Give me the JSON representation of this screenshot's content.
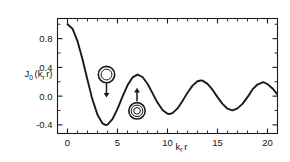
{
  "figure": {
    "background_color": "#ffffff",
    "line_color": "#1a1a1a",
    "axis_color": "#1a1a1a"
  },
  "axes": {
    "x_title_main": "k",
    "x_title_sub": "r",
    "x_title_tail": "r",
    "y_title_main": "J",
    "y_title_sub": "0",
    "y_title_open": "(k",
    "y_title_sub2": "r",
    "y_title_close": "r)"
  },
  "x_ticks": [
    {
      "value": 0,
      "label": "0"
    },
    {
      "value": 5,
      "label": "5"
    },
    {
      "value": 10,
      "label": "10"
    },
    {
      "value": 15,
      "label": "15"
    },
    {
      "value": 20,
      "label": "20"
    }
  ],
  "y_ticks": [
    {
      "value": 0.8,
      "label": "0.8"
    },
    {
      "value": 0.4,
      "label": "0.4"
    },
    {
      "value": 0.0,
      "label": "0.0"
    },
    {
      "value": -0.4,
      "label": "-0.4"
    }
  ],
  "annotations": [
    {
      "name": "ring-marker-upper",
      "type": "concentric-rings",
      "rings": 2,
      "cx": 3.9,
      "cy": 0.3,
      "arrow": "down",
      "arrow_from_y": 0.18,
      "arrow_to_y": -0.02
    },
    {
      "name": "ring-marker-lower",
      "type": "concentric-rings",
      "rings": 3,
      "cx": 6.95,
      "cy": -0.205,
      "arrow": "up",
      "arrow_from_y": -0.07,
      "arrow_to_y": 0.115
    }
  ],
  "chart_data": {
    "type": "line",
    "title": "",
    "xlabel": "k_r r",
    "ylabel": "J_0 (k_r r)",
    "xlim": [
      -1.0,
      21.0
    ],
    "ylim": [
      -0.52,
      1.08
    ],
    "grid": false,
    "legend": null,
    "series": [
      {
        "name": "J0(k_r r)",
        "x": [
          0.0,
          0.5,
          1.0,
          1.5,
          2.0,
          2.4048,
          2.5,
          3.0,
          3.5,
          3.8317,
          4.0,
          4.5,
          5.0,
          5.5,
          5.5201,
          6.0,
          6.5,
          7.0,
          7.0156,
          7.5,
          8.0,
          8.5,
          8.6537,
          9.0,
          9.5,
          10.0,
          10.1735,
          10.5,
          11.0,
          11.5,
          11.7915,
          12.0,
          12.5,
          13.0,
          13.3237,
          13.5,
          14.0,
          14.5,
          14.9309,
          15.0,
          15.5,
          16.0,
          16.4706,
          16.5,
          17.0,
          17.5,
          18.0,
          18.0711,
          18.5,
          19.0,
          19.5,
          19.6159,
          20.0,
          20.5,
          21.0
        ],
        "y": [
          1.0,
          0.938,
          0.765,
          0.512,
          0.224,
          0.0,
          -0.048,
          -0.26,
          -0.38,
          -0.402,
          -0.397,
          -0.321,
          -0.178,
          -0.007,
          0.0,
          0.151,
          0.26,
          0.3,
          0.3,
          0.266,
          0.172,
          0.042,
          0.0,
          -0.09,
          -0.194,
          -0.246,
          -0.249,
          -0.237,
          -0.171,
          -0.068,
          0.0,
          0.047,
          0.146,
          0.207,
          0.218,
          0.216,
          0.171,
          0.09,
          0.0,
          -0.014,
          -0.108,
          -0.175,
          -0.197,
          -0.197,
          -0.17,
          -0.108,
          -0.014,
          0.0,
          0.093,
          0.161,
          0.192,
          0.193,
          0.167,
          0.107,
          0.02
        ]
      }
    ]
  }
}
